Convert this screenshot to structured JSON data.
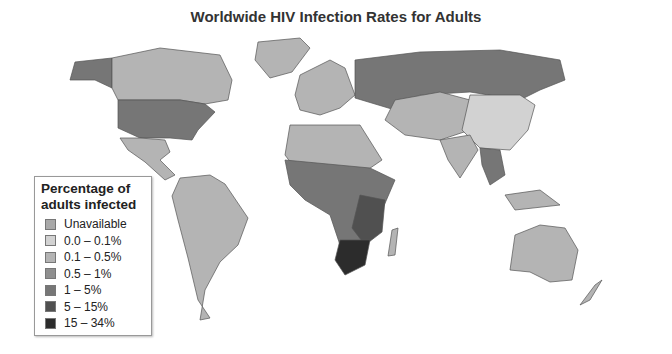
{
  "title": "Worldwide HIV Infection Rates for Adults",
  "legend": {
    "title_line1": "Percentage of",
    "title_line2": "adults infected",
    "items": [
      {
        "label": "Unavailable",
        "color": "#a9a9a9"
      },
      {
        "label": "0.0 – 0.1%",
        "color": "#d2d2d2"
      },
      {
        "label": "0.1 – 0.5%",
        "color": "#b4b4b4"
      },
      {
        "label": "0.5 – 1%",
        "color": "#8f8f8f"
      },
      {
        "label": "1 – 5%",
        "color": "#767676"
      },
      {
        "label": "5 – 15%",
        "color": "#505050"
      },
      {
        "label": "15 – 34%",
        "color": "#2c2c2c"
      }
    ]
  },
  "regions": [
    {
      "name": "Canada",
      "category": "0.1 – 0.5%"
    },
    {
      "name": "United States",
      "category": "0.5 – 1%"
    },
    {
      "name": "Mexico",
      "category": "0.1 – 0.5%"
    },
    {
      "name": "South America",
      "category": "0.1 – 0.5%"
    },
    {
      "name": "Russia",
      "category": "1 – 5%"
    },
    {
      "name": "China",
      "category": "0.0 – 0.1%"
    },
    {
      "name": "Southern Africa",
      "category": "15 – 34%"
    },
    {
      "name": "Australia",
      "category": "0.1 – 0.5%"
    }
  ]
}
